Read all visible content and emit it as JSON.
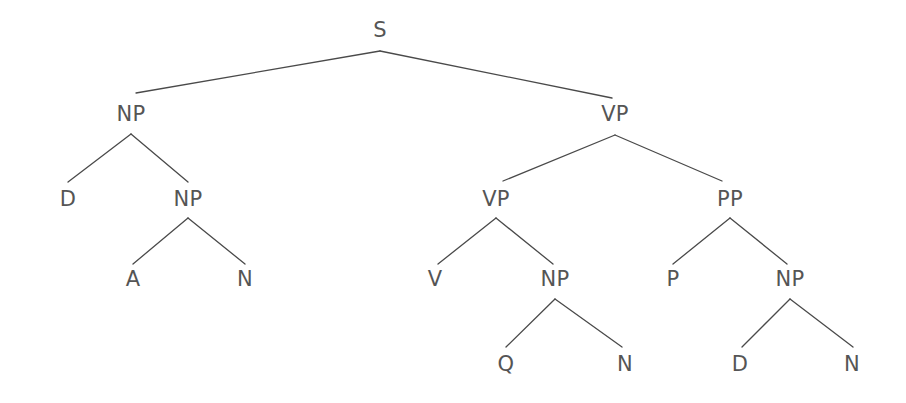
{
  "figure": {
    "type": "constituency-syntax-tree",
    "width": 906,
    "height": 403,
    "background_color": "#ffffff",
    "edge_color": "#4a4a4a",
    "edge_width": 1.3,
    "label_color": "#555555",
    "label_font_size": 21
  },
  "nodes": [
    {
      "id": "n0",
      "label": "S",
      "x": 380,
      "y": 30,
      "anchor_y": 51,
      "depth": 0
    },
    {
      "id": "n1",
      "label": "NP",
      "x": 131,
      "y": 114,
      "anchor_y": 134,
      "depth": 1
    },
    {
      "id": "n2",
      "label": "VP",
      "x": 615,
      "y": 114,
      "anchor_y": 135,
      "depth": 1
    },
    {
      "id": "n3",
      "label": "D",
      "x": 68,
      "y": 199,
      "anchor_y": 181,
      "depth": 2
    },
    {
      "id": "n4",
      "label": "NP",
      "x": 188,
      "y": 199,
      "anchor_y": 218,
      "depth": 2
    },
    {
      "id": "n5",
      "label": "VP",
      "x": 496,
      "y": 199,
      "anchor_y": 218,
      "depth": 2
    },
    {
      "id": "n6",
      "label": "PP",
      "x": 730,
      "y": 199,
      "anchor_y": 218,
      "depth": 2
    },
    {
      "id": "n7",
      "label": "A",
      "x": 133,
      "y": 279,
      "anchor_y": 268,
      "depth": 3
    },
    {
      "id": "n8",
      "label": "N",
      "x": 245,
      "y": 279,
      "anchor_y": 268,
      "depth": 3
    },
    {
      "id": "n9",
      "label": "V",
      "x": 435,
      "y": 279,
      "anchor_y": 268,
      "depth": 3
    },
    {
      "id": "n10",
      "label": "NP",
      "x": 555,
      "y": 279,
      "anchor_y": 299,
      "depth": 3
    },
    {
      "id": "n11",
      "label": "P",
      "x": 673,
      "y": 279,
      "anchor_y": 268,
      "depth": 3
    },
    {
      "id": "n12",
      "label": "NP",
      "x": 790,
      "y": 279,
      "anchor_y": 299,
      "depth": 3
    },
    {
      "id": "n13",
      "label": "Q",
      "x": 506,
      "y": 364,
      "anchor_y": 349,
      "depth": 4
    },
    {
      "id": "n14",
      "label": "N",
      "x": 625,
      "y": 364,
      "anchor_y": 349,
      "depth": 4
    },
    {
      "id": "n15",
      "label": "D",
      "x": 740,
      "y": 364,
      "anchor_y": 349,
      "depth": 4
    },
    {
      "id": "n16",
      "label": "N",
      "x": 852,
      "y": 364,
      "anchor_y": 349,
      "depth": 4
    }
  ],
  "edges": [
    {
      "from": "n0",
      "to": "n1",
      "x1": 380,
      "y1": 51,
      "x2": 136,
      "y2": 93
    },
    {
      "from": "n0",
      "to": "n2",
      "x1": 380,
      "y1": 51,
      "x2": 612,
      "y2": 98
    },
    {
      "from": "n1",
      "to": "n3",
      "x1": 131,
      "y1": 134,
      "x2": 68,
      "y2": 182
    },
    {
      "from": "n1",
      "to": "n4",
      "x1": 131,
      "y1": 134,
      "x2": 188,
      "y2": 182
    },
    {
      "from": "n4",
      "to": "n7",
      "x1": 188,
      "y1": 218,
      "x2": 133,
      "y2": 264
    },
    {
      "from": "n4",
      "to": "n8",
      "x1": 188,
      "y1": 218,
      "x2": 245,
      "y2": 264
    },
    {
      "from": "n2",
      "to": "n5",
      "x1": 615,
      "y1": 135,
      "x2": 503,
      "y2": 181
    },
    {
      "from": "n2",
      "to": "n6",
      "x1": 615,
      "y1": 135,
      "x2": 722,
      "y2": 181
    },
    {
      "from": "n5",
      "to": "n9",
      "x1": 496,
      "y1": 218,
      "x2": 438,
      "y2": 264
    },
    {
      "from": "n5",
      "to": "n10",
      "x1": 496,
      "y1": 218,
      "x2": 553,
      "y2": 264
    },
    {
      "from": "n6",
      "to": "n11",
      "x1": 730,
      "y1": 218,
      "x2": 673,
      "y2": 264
    },
    {
      "from": "n6",
      "to": "n12",
      "x1": 730,
      "y1": 218,
      "x2": 787,
      "y2": 264
    },
    {
      "from": "n10",
      "to": "n13",
      "x1": 555,
      "y1": 299,
      "x2": 506,
      "y2": 347
    },
    {
      "from": "n10",
      "to": "n14",
      "x1": 555,
      "y1": 299,
      "x2": 622,
      "y2": 347
    },
    {
      "from": "n12",
      "to": "n15",
      "x1": 790,
      "y1": 299,
      "x2": 742,
      "y2": 347
    },
    {
      "from": "n12",
      "to": "n16",
      "x1": 790,
      "y1": 299,
      "x2": 853,
      "y2": 347
    }
  ]
}
